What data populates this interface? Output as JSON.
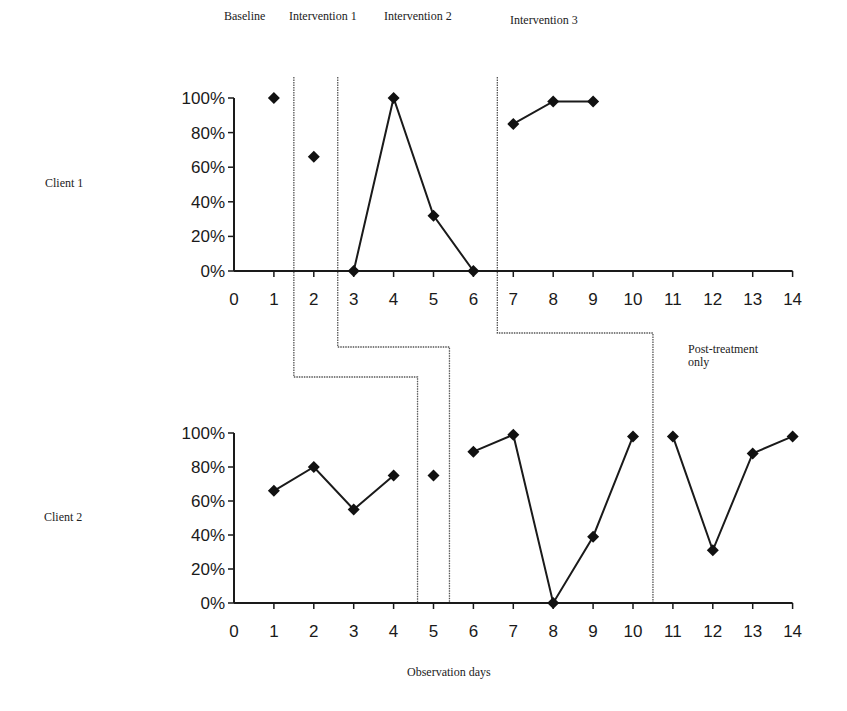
{
  "phase_labels": {
    "baseline": "Baseline",
    "intervention_1": "Intervention 1",
    "intervention_2": "Intervention 2",
    "intervention_3": "Intervention 3",
    "post_treatment": "Post-treatment only"
  },
  "post_treatment_lines": [
    "Post-treatment",
    "only"
  ],
  "client_labels": [
    "Client 1",
    "Client 2"
  ],
  "x_axis_label": "Observation days",
  "colors": {
    "line": "#1a1a1a",
    "marker": "#111111",
    "divider": "#555555"
  },
  "chart_data": [
    {
      "type": "line",
      "title": "Client 1",
      "xlabel": "Observation days",
      "ylabel": "",
      "x_ticks": [
        0,
        1,
        2,
        3,
        4,
        5,
        6,
        7,
        8,
        9,
        10,
        11,
        12,
        13,
        14
      ],
      "y_ticks": [
        "0%",
        "20%",
        "40%",
        "60%",
        "80%",
        "100%"
      ],
      "xlim": [
        0,
        14
      ],
      "ylim": [
        0,
        100
      ],
      "grid": false,
      "phases": [
        {
          "name": "Baseline",
          "days": [
            1
          ]
        },
        {
          "name": "Intervention 1",
          "days": [
            2
          ]
        },
        {
          "name": "Intervention 2",
          "days": [
            3,
            4,
            5,
            6
          ]
        },
        {
          "name": "Intervention 3",
          "days": [
            7,
            8,
            9
          ]
        }
      ],
      "phase_change_after_day": [
        1.5,
        2.6,
        6.6
      ],
      "series": [
        {
          "name": "Baseline",
          "points": [
            [
              1,
              100
            ]
          ]
        },
        {
          "name": "Intervention 1",
          "points": [
            [
              2,
              66
            ]
          ]
        },
        {
          "name": "Intervention 2",
          "points": [
            [
              3,
              0
            ],
            [
              4,
              100
            ],
            [
              5,
              32
            ],
            [
              6,
              0
            ]
          ]
        },
        {
          "name": "Intervention 3",
          "points": [
            [
              7,
              85
            ],
            [
              8,
              98
            ],
            [
              9,
              98
            ]
          ]
        }
      ]
    },
    {
      "type": "line",
      "title": "Client 2",
      "xlabel": "Observation days",
      "ylabel": "",
      "x_ticks": [
        0,
        1,
        2,
        3,
        4,
        5,
        6,
        7,
        8,
        9,
        10,
        11,
        12,
        13,
        14
      ],
      "y_ticks": [
        "0%",
        "20%",
        "40%",
        "60%",
        "80%",
        "100%"
      ],
      "xlim": [
        0,
        14
      ],
      "ylim": [
        0,
        100
      ],
      "grid": false,
      "phases": [
        {
          "name": "Baseline",
          "days": [
            1,
            2,
            3,
            4
          ]
        },
        {
          "name": "Intervention 1",
          "days": [
            5
          ]
        },
        {
          "name": "Intervention 2",
          "days": [
            6,
            7,
            8,
            9,
            10
          ]
        },
        {
          "name": "Post-treatment only",
          "days": [
            11,
            12,
            13,
            14
          ]
        }
      ],
      "phase_change_after_day": [
        4.6,
        5.4,
        10.5
      ],
      "series": [
        {
          "name": "Baseline",
          "points": [
            [
              1,
              66
            ],
            [
              2,
              80
            ],
            [
              3,
              55
            ],
            [
              4,
              75
            ]
          ]
        },
        {
          "name": "Intervention 1",
          "points": [
            [
              5,
              75
            ]
          ]
        },
        {
          "name": "Intervention 2",
          "points": [
            [
              6,
              89
            ],
            [
              7,
              99
            ],
            [
              8,
              0
            ],
            [
              9,
              39
            ],
            [
              10,
              98
            ]
          ]
        },
        {
          "name": "Post-treatment only",
          "points": [
            [
              11,
              98
            ],
            [
              12,
              31
            ],
            [
              13,
              88
            ],
            [
              14,
              98
            ]
          ]
        }
      ]
    }
  ]
}
